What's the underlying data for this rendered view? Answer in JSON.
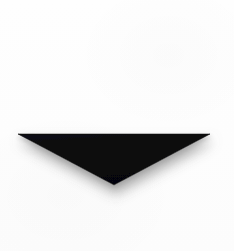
{
  "canvas": {
    "width": 234,
    "height": 251,
    "background_color": "#fdfdfd",
    "description": "Scanned white page with a solid black downward-pointing triangle"
  },
  "figure": {
    "name": "downward-triangle",
    "shape": "triangle",
    "orientation": "pointing-down",
    "fill_color": "#0a0a0c",
    "edge_style": "hard-top-edge-soft-lower-edges",
    "vertices": [
      {
        "label": "top-left",
        "x": 18,
        "y": 134
      },
      {
        "label": "top-right",
        "x": 210,
        "y": 134
      },
      {
        "label": "bottom-apex",
        "x": 114,
        "y": 185
      }
    ],
    "top_edge_y": 134,
    "apex_y": 185,
    "width_px": 192,
    "height_px": 51
  },
  "shadow": {
    "name": "drop-shadow",
    "color": "#8a8a8a",
    "blur_px": 9,
    "offset_x": 2,
    "offset_y": 7,
    "opacity": 0.55,
    "fade_end_y": 212
  }
}
